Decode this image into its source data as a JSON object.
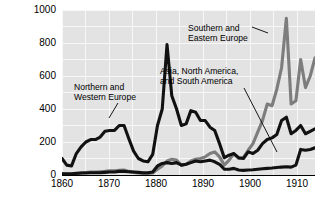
{
  "chart_data": {
    "type": "line",
    "title": "",
    "xlabel": "",
    "ylabel": "Thousands of Immigrants",
    "xlim": [
      1860,
      1913
    ],
    "ylim": [
      0,
      1000
    ],
    "yticks": [
      0,
      200,
      400,
      600,
      800,
      1000
    ],
    "xticks": [
      1860,
      1870,
      1880,
      1890,
      1900,
      1910
    ],
    "grid": true,
    "legend_position": "annotations-inline",
    "annotations": [
      {
        "id": "nw-europe",
        "text_line1": "Northern and",
        "text_line2": "Western Europe"
      },
      {
        "id": "se-europe",
        "text_line1": "Southern and",
        "text_line2": "Eastern Europe"
      },
      {
        "id": "asia-americas",
        "text_line1": "Asia, North America,",
        "text_line2": "and South America"
      }
    ],
    "series": [
      {
        "name": "Northern and Western Europe",
        "color": "#111111",
        "x": [
          1860,
          1861,
          1862,
          1863,
          1864,
          1865,
          1866,
          1867,
          1868,
          1869,
          1870,
          1871,
          1872,
          1873,
          1874,
          1875,
          1876,
          1877,
          1878,
          1879,
          1880,
          1881,
          1882,
          1883,
          1884,
          1885,
          1886,
          1887,
          1888,
          1889,
          1890,
          1891,
          1892,
          1893,
          1894,
          1895,
          1896,
          1897,
          1898,
          1899,
          1900,
          1901,
          1902,
          1903,
          1904,
          1905,
          1906,
          1907,
          1908,
          1909,
          1910,
          1911,
          1912,
          1913
        ],
        "values": [
          100,
          60,
          55,
          130,
          170,
          200,
          215,
          215,
          230,
          265,
          270,
          270,
          300,
          300,
          220,
          145,
          100,
          85,
          80,
          125,
          300,
          400,
          790,
          480,
          400,
          300,
          310,
          390,
          380,
          330,
          330,
          290,
          270,
          190,
          105,
          120,
          130,
          105,
          100,
          140,
          130,
          150,
          190,
          215,
          225,
          245,
          330,
          350,
          250,
          270,
          300,
          250,
          265,
          280
        ]
      },
      {
        "name": "Southern and Eastern Europe",
        "color": "#7d7d7d",
        "x": [
          1860,
          1861,
          1862,
          1863,
          1864,
          1865,
          1866,
          1867,
          1868,
          1869,
          1870,
          1871,
          1872,
          1873,
          1874,
          1875,
          1876,
          1877,
          1878,
          1879,
          1880,
          1881,
          1882,
          1883,
          1884,
          1885,
          1886,
          1887,
          1888,
          1889,
          1890,
          1891,
          1892,
          1893,
          1894,
          1895,
          1896,
          1897,
          1898,
          1899,
          1900,
          1901,
          1902,
          1903,
          1904,
          1905,
          1906,
          1907,
          1908,
          1909,
          1910,
          1911,
          1912,
          1913
        ],
        "values": [
          8,
          6,
          5,
          8,
          12,
          15,
          18,
          18,
          20,
          22,
          25,
          25,
          28,
          30,
          22,
          16,
          12,
          10,
          9,
          12,
          35,
          55,
          85,
          95,
          90,
          60,
          65,
          85,
          95,
          100,
          110,
          130,
          140,
          110,
          60,
          90,
          130,
          100,
          105,
          150,
          190,
          260,
          330,
          430,
          420,
          520,
          650,
          950,
          430,
          450,
          700,
          530,
          600,
          710
        ]
      },
      {
        "name": "Asia, North America, and South America",
        "color": "#111111",
        "x": [
          1860,
          1861,
          1862,
          1863,
          1864,
          1865,
          1866,
          1867,
          1868,
          1869,
          1870,
          1871,
          1872,
          1873,
          1874,
          1875,
          1876,
          1877,
          1878,
          1879,
          1880,
          1881,
          1882,
          1883,
          1884,
          1885,
          1886,
          1887,
          1888,
          1889,
          1890,
          1891,
          1892,
          1893,
          1894,
          1895,
          1896,
          1897,
          1898,
          1899,
          1900,
          1901,
          1902,
          1903,
          1904,
          1905,
          1906,
          1907,
          1908,
          1909,
          1910,
          1911,
          1912,
          1913
        ],
        "values": [
          8,
          8,
          8,
          10,
          12,
          12,
          14,
          14,
          14,
          16,
          18,
          18,
          22,
          22,
          20,
          18,
          16,
          14,
          14,
          18,
          55,
          70,
          75,
          70,
          75,
          60,
          65,
          75,
          85,
          80,
          85,
          90,
          80,
          65,
          35,
          35,
          40,
          30,
          28,
          30,
          32,
          35,
          38,
          40,
          42,
          45,
          48,
          50,
          48,
          60,
          155,
          150,
          155,
          165
        ]
      }
    ]
  },
  "axis": {
    "ylabel": "Thousands of Immigrants",
    "ytick_labels": [
      "1000",
      "800",
      "600",
      "400",
      "200",
      "0"
    ],
    "xtick_labels": [
      "1860",
      "1870",
      "1880",
      "1890",
      "1900",
      "1910"
    ]
  },
  "annotations": {
    "nw_line1": "Northern and",
    "nw_line2": "Western Europe",
    "se_line1": "Southern and",
    "se_line2": "Eastern Europe",
    "asia_line1": "Asia, North America,",
    "asia_line2": "and South America"
  }
}
